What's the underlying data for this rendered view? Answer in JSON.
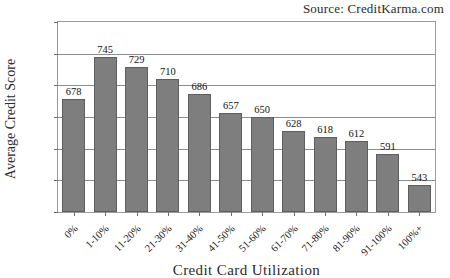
{
  "source_note": "Source: CreditKarma.com",
  "chart_data": {
    "type": "bar",
    "title": "",
    "subtitle": "",
    "xlabel": "Credit Card Utilization",
    "ylabel": "Average Credit Score",
    "categories": [
      "0%",
      "1-10%",
      "11-20%",
      "21-30%",
      "31-40%",
      "41-50%",
      "51-60%",
      "61-70%",
      "71-80%",
      "81-90%",
      "91-100%",
      "100%+"
    ],
    "values": [
      678,
      745,
      729,
      710,
      686,
      657,
      650,
      628,
      618,
      612,
      591,
      543
    ],
    "series": [
      {
        "name": "Average Credit Score",
        "values": [
          678,
          745,
          729,
          710,
          686,
          657,
          650,
          628,
          618,
          612,
          591,
          543
        ]
      }
    ],
    "ylim": [
      500,
      800
    ],
    "yticks": [
      500,
      550,
      600,
      650,
      700,
      750,
      800
    ],
    "ytick_labels": [
      "500",
      "550",
      "600",
      "650",
      "700",
      "750",
      "800"
    ],
    "data_labels": [
      "678",
      "745",
      "729",
      "710",
      "686",
      "657",
      "650",
      "628",
      "618",
      "612",
      "591",
      "543"
    ],
    "grid": true,
    "grid_axis": "y",
    "legend": false,
    "legend_position": "none",
    "bar_color": "#7e7e7e",
    "bar_edge_color": "#5e5e5e",
    "grid_color": "#8d8d8d",
    "axis_color": "#9a9a9a",
    "text_color": "#1a1a1a",
    "background": "#ffffff",
    "xtick_rotation": -45,
    "annotations": [
      "Source: CreditKarma.com"
    ]
  }
}
